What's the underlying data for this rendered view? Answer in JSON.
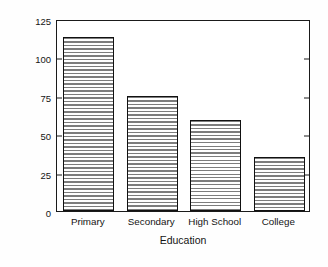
{
  "chart_data": {
    "type": "bar",
    "title": "",
    "xlabel": "Education",
    "ylabel": "Standardized Incidence Ratio",
    "categories": [
      "Primary",
      "Secondary",
      "High School",
      "College"
    ],
    "values": [
      113,
      75,
      59,
      35
    ],
    "ylim": [
      0,
      125
    ],
    "yticks": [
      0,
      25,
      50,
      75,
      100,
      125
    ],
    "ytick_labels": [
      "0",
      "25",
      "50",
      "75",
      "100",
      "125"
    ],
    "grid": false,
    "legend": null,
    "bar_fill": "horizontal-hatch",
    "bar_edge_color": "#111111",
    "bar_hatch_color": "#7d7d7d",
    "axis_color": "#1a1a1a",
    "background_color": "#fefefe"
  }
}
